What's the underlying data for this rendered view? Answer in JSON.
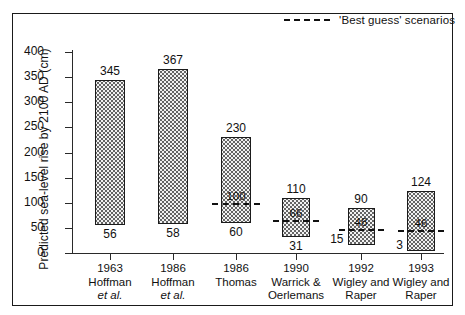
{
  "legend": {
    "label": "'Best guess' scenarios",
    "dash_sample": "dashed-line-icon"
  },
  "chart_data": {
    "type": "bar",
    "title": "",
    "xlabel": "",
    "ylabel": "Predicted sea-level rise by 2100 AD (cm)",
    "ylim": [
      0,
      400
    ],
    "yticks": [
      0,
      50,
      100,
      150,
      200,
      250,
      300,
      350,
      400
    ],
    "ytick_labels": [
      "0",
      "50",
      "100",
      "150",
      "200",
      "250",
      "300",
      "350",
      "400"
    ],
    "grid": false,
    "legend_position": "top-right",
    "categories": [
      "1963 Hoffman et al.",
      "1986 Hoffman et al.",
      "1986 Thomas",
      "1990 Warrick & Oerlemans",
      "1992 Wigley and Raper",
      "1993 Wigley and Raper"
    ],
    "category_lines": [
      [
        "1963",
        "Hoffman",
        "et al."
      ],
      [
        "1986",
        "Hoffman",
        "et al."
      ],
      [
        "1986",
        "Thomas",
        ""
      ],
      [
        "1990",
        "Warrick &",
        "Oerlemans"
      ],
      [
        "1992",
        "Wigley and",
        "Raper"
      ],
      [
        "1993",
        "Wigley and",
        "Raper"
      ]
    ],
    "series": [
      {
        "name": "High estimate",
        "values": [
          345,
          367,
          230,
          110,
          90,
          124
        ]
      },
      {
        "name": "Low estimate",
        "values": [
          56,
          58,
          60,
          31,
          15,
          3
        ]
      },
      {
        "name": "'Best guess' scenario",
        "values": [
          null,
          null,
          100,
          66,
          48,
          46
        ]
      }
    ],
    "bars": [
      {
        "high": 345,
        "low": 56,
        "best_guess": null,
        "high_label": "345",
        "low_label": "56",
        "best_guess_label": ""
      },
      {
        "high": 367,
        "low": 58,
        "best_guess": null,
        "high_label": "367",
        "low_label": "58",
        "best_guess_label": ""
      },
      {
        "high": 230,
        "low": 60,
        "best_guess": 100,
        "high_label": "230",
        "low_label": "60",
        "best_guess_label": "100"
      },
      {
        "high": 110,
        "low": 31,
        "best_guess": 66,
        "high_label": "110",
        "low_label": "31",
        "best_guess_label": "66"
      },
      {
        "high": 90,
        "low": 15,
        "best_guess": 48,
        "high_label": "90",
        "low_label": "15",
        "best_guess_label": "48"
      },
      {
        "high": 124,
        "low": 3,
        "best_guess": 46,
        "high_label": "124",
        "low_label": "3",
        "best_guess_label": "46"
      }
    ]
  },
  "colors": {
    "ink": "#111111",
    "bar_fill": "#f2f2f2",
    "bar_stipple": "#5a5a5a",
    "frame": "#1a1a1a"
  }
}
